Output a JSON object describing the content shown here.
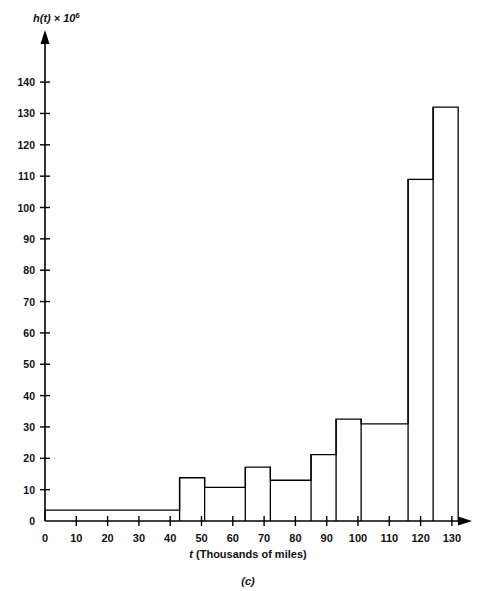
{
  "figure": {
    "panel_label": "(c)",
    "y_axis_title": "h(t) × 10",
    "y_axis_title_exponent": "6",
    "x_axis_title_symbol": "t",
    "x_axis_title_rest": " (Thousands of miles)"
  },
  "chart_data": {
    "type": "bar",
    "title": "",
    "subtitle": "",
    "xlabel": "t (Thousands of miles)",
    "ylabel": "h(t) × 10^6",
    "xlim": [
      0,
      136
    ],
    "ylim": [
      0,
      146
    ],
    "grid": false,
    "legend": null,
    "x_ticks": [
      0,
      10,
      20,
      30,
      40,
      50,
      60,
      70,
      80,
      90,
      100,
      110,
      120,
      130
    ],
    "y_ticks": [
      0,
      10,
      20,
      30,
      40,
      50,
      60,
      70,
      80,
      90,
      100,
      110,
      120,
      130,
      140
    ],
    "x_tick_labels": [
      "0",
      "10",
      "20",
      "30",
      "40",
      "50",
      "60",
      "70",
      "80",
      "90",
      "100",
      "110",
      "120",
      "130"
    ],
    "y_tick_labels": [
      "0",
      "10",
      "20",
      "30",
      "40",
      "50",
      "60",
      "70",
      "80",
      "90",
      "100",
      "110",
      "120",
      "130",
      "140"
    ],
    "bins": [
      {
        "x0": 0,
        "x1": 43,
        "value": 3.5
      },
      {
        "x0": 43,
        "x1": 51,
        "value": 13.8
      },
      {
        "x0": 51,
        "x1": 64,
        "value": 10.7
      },
      {
        "x0": 64,
        "x1": 72,
        "value": 17.2
      },
      {
        "x0": 72,
        "x1": 85,
        "value": 13.0
      },
      {
        "x0": 85,
        "x1": 93,
        "value": 21.2
      },
      {
        "x0": 93,
        "x1": 101,
        "value": 32.5
      },
      {
        "x0": 101,
        "x1": 116,
        "value": 31.0
      },
      {
        "x0": 116,
        "x1": 124,
        "value": 109.0
      },
      {
        "x0": 124,
        "x1": 132,
        "value": 132.0
      }
    ],
    "categories": [
      "0-43",
      "43-51",
      "51-64",
      "64-72",
      "72-85",
      "85-93",
      "93-101",
      "101-116",
      "116-124",
      "124-132"
    ],
    "values": [
      3.5,
      13.8,
      10.7,
      17.2,
      13.0,
      21.2,
      32.5,
      31.0,
      109.0,
      132.0
    ]
  },
  "colors": {
    "ink": "#000000",
    "background": "#ffffff"
  }
}
